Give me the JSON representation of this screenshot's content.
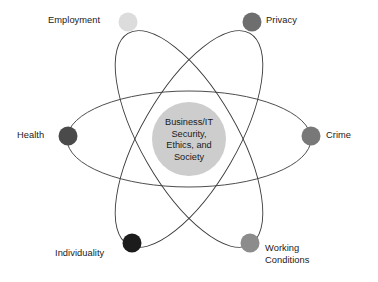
{
  "diagram": {
    "title_text_lines": [
      "Business/IT",
      "Security,",
      "Ethics, and",
      "Society"
    ],
    "center": {
      "label": "Business/IT Security, Ethics, and Society",
      "cx": 189,
      "cy": 139,
      "r": 37,
      "fill": "#cdcdcd"
    },
    "background_color": "#ffffff",
    "orbit_stroke_color": "#3a3a3a",
    "orbits": [
      {
        "name": "orbit-horizontal",
        "rx": 122,
        "ry": 48,
        "rotation_deg": 0
      },
      {
        "name": "orbit-tilted-up",
        "rx": 122,
        "ry": 48,
        "rotation_deg": -60
      },
      {
        "name": "orbit-tilted-down",
        "rx": 122,
        "ry": 48,
        "rotation_deg": 60
      }
    ],
    "nodes": [
      {
        "id": "employment",
        "label": "Employment",
        "cx": 128,
        "cy": 22,
        "r": 9.5,
        "color": "#dcdcdc"
      },
      {
        "id": "privacy",
        "label": "Privacy",
        "cx": 252,
        "cy": 22,
        "r": 9.5,
        "color": "#6e6e6e"
      },
      {
        "id": "health",
        "label": "Health",
        "cx": 68,
        "cy": 136,
        "r": 9.5,
        "color": "#4a4a4a"
      },
      {
        "id": "crime",
        "label": "Crime",
        "cx": 311,
        "cy": 136,
        "r": 9.5,
        "color": "#787878"
      },
      {
        "id": "individuality",
        "label": "Individuality",
        "cx": 132,
        "cy": 243,
        "r": 9.5,
        "color": "#1c1c1c"
      },
      {
        "id": "working-conditions",
        "label": "Working Conditions",
        "label_line_1": "Working",
        "label_line_2": "Conditions",
        "cx": 250,
        "cy": 243,
        "r": 9.5,
        "color": "#8c8c8c"
      }
    ]
  }
}
